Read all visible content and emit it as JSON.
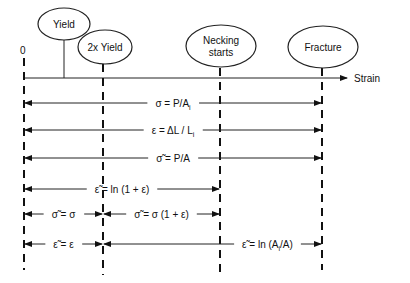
{
  "axis": {
    "origin_label": "0",
    "axis_label": "Strain"
  },
  "events": [
    {
      "id": "yield",
      "label_lines": [
        "Yield"
      ]
    },
    {
      "id": "two-x-yield",
      "label_lines": [
        "2x Yield"
      ]
    },
    {
      "id": "necking",
      "label_lines": [
        "Necking",
        "starts"
      ]
    },
    {
      "id": "fracture",
      "label_lines": [
        "Fracture"
      ]
    }
  ],
  "relations": [
    {
      "id": "eng-stress",
      "text": "σ = P/A",
      "sub": "i",
      "tail": "",
      "from": "origin",
      "to": "fracture"
    },
    {
      "id": "eng-strain",
      "text": "ε = ΔL / L",
      "sub": "i",
      "tail": "",
      "from": "origin",
      "to": "fracture"
    },
    {
      "id": "true-stress",
      "text": "σ̃ = P/A",
      "sub": "",
      "tail": "",
      "from": "origin",
      "to": "fracture"
    },
    {
      "id": "true-strain-ln",
      "text": "ε̃ = ln (1 + ε)",
      "sub": "",
      "tail": "",
      "from": "origin",
      "to": "necking"
    },
    {
      "id": "true-stress-small",
      "text": "σ̃ = σ",
      "sub": "",
      "tail": "",
      "from": "origin",
      "to": "two-x-yield"
    },
    {
      "id": "true-stress-mid",
      "text": "σ̃ = σ (1 + ε)",
      "sub": "",
      "tail": "",
      "from": "two-x-yield",
      "to": "necking"
    },
    {
      "id": "true-strain-small",
      "text": "ε̃ = ε",
      "sub": "",
      "tail": "",
      "from": "origin",
      "to": "two-x-yield"
    },
    {
      "id": "true-strain-area",
      "text": "ε̃ = ln (A",
      "sub": "i",
      "tail": "/A)",
      "from": "two-x-yield",
      "to": "fracture"
    }
  ]
}
